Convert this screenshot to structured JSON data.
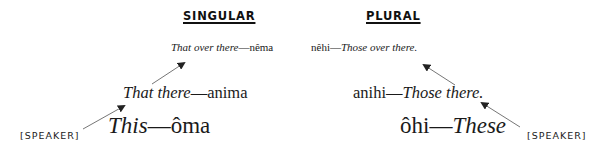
{
  "headings": {
    "singular": "SINGULAR",
    "plural": "PLURAL"
  },
  "singular": {
    "far": {
      "english": "That over there",
      "dash": "—",
      "cree": "nêma"
    },
    "mid": {
      "english": "That there",
      "dash": "—",
      "cree": "anima"
    },
    "near": {
      "english": "This",
      "dash": "—",
      "cree": "ôma"
    },
    "speaker_label": "[SPEAKER]"
  },
  "plural": {
    "far": {
      "cree": "nêhi",
      "dash": "—",
      "english": "Those over there."
    },
    "mid": {
      "cree": "anihi",
      "dash": "—",
      "english": "Those there."
    },
    "near": {
      "cree": "ôhi",
      "dash": "—",
      "english": "These"
    },
    "speaker_label": "[SPEAKER]"
  },
  "colors": {
    "text": "#1a1a1a",
    "arrow": "#555555"
  }
}
